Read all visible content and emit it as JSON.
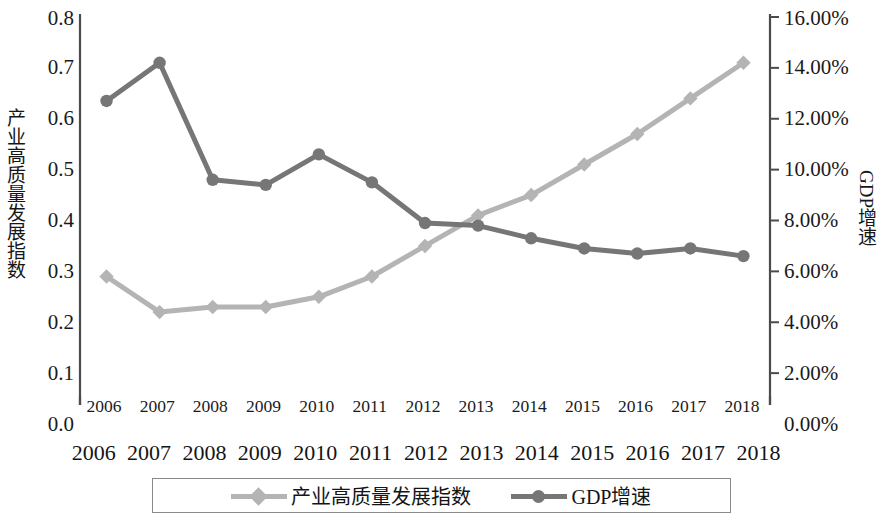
{
  "chart_data": {
    "type": "line",
    "title": "",
    "xlabel": "",
    "categories": [
      "2006",
      "2007",
      "2008",
      "2009",
      "2010",
      "2011",
      "2012",
      "2013",
      "2014",
      "2015",
      "2016",
      "2017",
      "2018"
    ],
    "series": [
      {
        "name": "产业高质量发展指数",
        "axis": "left",
        "color": "#b4b4b4",
        "marker": "diamond",
        "values": [
          0.29,
          0.22,
          0.23,
          0.23,
          0.25,
          0.29,
          0.35,
          0.41,
          0.45,
          0.51,
          0.57,
          0.64,
          0.71
        ]
      },
      {
        "name": "GDP增速",
        "axis": "right",
        "color": "#767676",
        "marker": "circle",
        "values": [
          12.7,
          14.2,
          9.6,
          9.4,
          10.6,
          9.5,
          7.9,
          7.8,
          7.3,
          6.9,
          6.7,
          6.9,
          6.6
        ]
      }
    ],
    "left_axis": {
      "label": "产业高质量发展指数",
      "ticks": [
        "0.0",
        "0.1",
        "0.2",
        "0.3",
        "0.4",
        "0.5",
        "0.6",
        "0.7",
        "0.8"
      ],
      "min": 0.0,
      "max": 0.8
    },
    "right_axis": {
      "label": "GDP增速",
      "ticks": [
        "0.00%",
        "2.00%",
        "4.00%",
        "6.00%",
        "8.00%",
        "10.00%",
        "12.00%",
        "14.00%",
        "16.00%"
      ],
      "min": 0.0,
      "max": 16.0,
      "unit": "%"
    },
    "x_axis_labels_primary": [
      "2006",
      "2007",
      "2008",
      "2009",
      "2010",
      "2011",
      "2012",
      "2013",
      "2014",
      "2015",
      "2016",
      "2017",
      "2018"
    ],
    "x_axis_labels_secondary": [
      "2006",
      "2007",
      "2008",
      "2009",
      "2010",
      "2011",
      "2012",
      "2013",
      "2014",
      "2015",
      "2016",
      "2017",
      "2018"
    ],
    "legend": {
      "position": "bottom",
      "entries": [
        {
          "label": "产业高质量发展指数",
          "color": "#b4b4b4",
          "marker": "diamond"
        },
        {
          "label": "GDP增速",
          "color": "#767676",
          "marker": "circle"
        }
      ]
    },
    "grid": false,
    "colors": {
      "index_series": "#b4b4b4",
      "gdp_series": "#767676",
      "axis": "#4b4b4b",
      "text": "#1a1a1a",
      "background": "#ffffff"
    }
  }
}
